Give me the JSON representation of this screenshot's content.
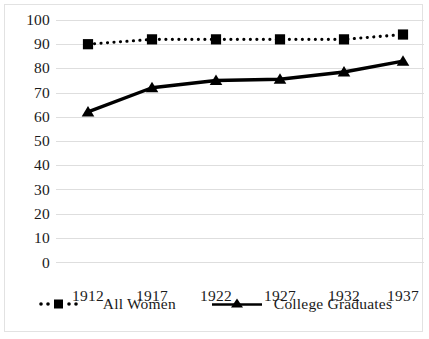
{
  "chart_data": {
    "type": "line",
    "title": "",
    "subtitle": "",
    "xlabel": "",
    "ylabel": "",
    "categories": [
      "1912",
      "1917",
      "1922",
      "1927",
      "1932",
      "1937"
    ],
    "x": [
      1912,
      1917,
      1922,
      1927,
      1932,
      1937
    ],
    "series": [
      {
        "name": "All Women",
        "values": [
          90,
          92,
          92,
          92,
          92,
          94
        ],
        "marker": "square",
        "linestyle": "dotted",
        "color": "#000000"
      },
      {
        "name": "College Graduates",
        "values": [
          62,
          72,
          75,
          75.5,
          78.5,
          83
        ],
        "marker": "triangle",
        "linestyle": "solid",
        "color": "#000000"
      }
    ],
    "ylim": [
      0,
      100
    ],
    "ytick_labels": [
      "100",
      "90",
      "80",
      "70",
      "60",
      "50",
      "40",
      "30",
      "20",
      "10",
      "0"
    ],
    "ytick_values": [
      100,
      90,
      80,
      70,
      60,
      50,
      40,
      30,
      20,
      10,
      0
    ],
    "xtick_labels": [
      "1912",
      "1917",
      "1922",
      "1927",
      "1932",
      "1937"
    ],
    "grid": true,
    "grid_axis": "y",
    "grid_color": "#dedede",
    "legend_position": "bottom",
    "plot_background": "#ffffff",
    "border_color": "#e2e2e2"
  },
  "legend": {
    "items": [
      {
        "label": "All Women",
        "icon": "dotted-line-square-marker"
      },
      {
        "label": "College Graduates",
        "icon": "solid-line-triangle-marker"
      }
    ]
  }
}
